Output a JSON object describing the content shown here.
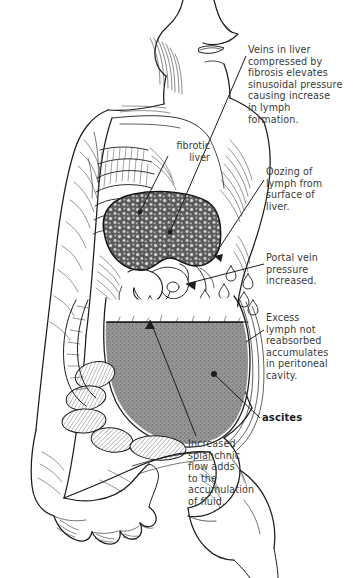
{
  "figure": {
    "background_color": "#ffffff",
    "ink_color": "#1d1d1d",
    "fluid_color": "#8e8e8e",
    "liver_color": "#6f6f6f"
  },
  "labels": {
    "fibrotic_liver": "fibrotic\nliver",
    "ascites": "ascites"
  },
  "callouts": [
    {
      "id": "veins-in-liver",
      "text": "Veins in liver\ncompressed by\nfibrosis elevates\nsinusoidal pressure\ncausing increase\nin lymph\nformation.",
      "bold": false
    },
    {
      "id": "oozing-of-lymph",
      "text": "Oozing of\nlymph from\nsurface of\nliver.",
      "bold": false
    },
    {
      "id": "portal-vein-pressure",
      "text": "Portal vein\npressure\nincreased.",
      "bold": false
    },
    {
      "id": "excess-lymph",
      "text": "Excess\nlymph not\nreabsorbed\naccumulates\nin peritoneal\ncavity.",
      "bold": false
    },
    {
      "id": "increased-splanchnic-flow",
      "text": "Increased\nsplanchnic\nflow adds\nto the\naccumulation\nof fluid.",
      "bold": false
    }
  ],
  "anatomy": {
    "parts": [
      "head-and-neck",
      "left-arm",
      "hand",
      "rib-cage",
      "fibrotic-liver",
      "stomach",
      "duodenum",
      "intestinal-loops",
      "peritoneal-cavity",
      "ascitic-fluid",
      "pelvis-and-thigh",
      "lymph-droplets"
    ]
  }
}
